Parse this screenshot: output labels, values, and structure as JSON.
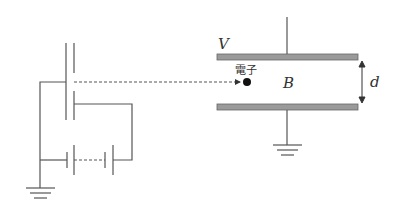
{
  "diagram": {
    "type": "physics-circuit",
    "labels": {
      "voltage": "V",
      "electron": "電子",
      "magnetic_field": "B",
      "plate_separation": "d"
    },
    "colors": {
      "line": "#555555",
      "plate_fill": "#9a9a9a",
      "plate_stroke": "#666666",
      "electron": "#111111"
    },
    "components": [
      {
        "id": "accelerating-electrodes",
        "description": "pair of parallel electrode plates with aperture"
      },
      {
        "id": "battery-bank",
        "description": "series battery cells with dashed connection"
      },
      {
        "id": "ground-left",
        "description": "ground symbol"
      },
      {
        "id": "electron-path",
        "description": "dashed trajectory with arrow to electron"
      },
      {
        "id": "electron",
        "description": "electron particle"
      },
      {
        "id": "capacitor-top-plate",
        "description": "upper plate at potential V"
      },
      {
        "id": "capacitor-bottom-plate",
        "description": "lower grounded plate"
      },
      {
        "id": "ground-right",
        "description": "ground symbol"
      },
      {
        "id": "separation-arrow",
        "description": "double arrow showing plate separation d"
      }
    ]
  }
}
